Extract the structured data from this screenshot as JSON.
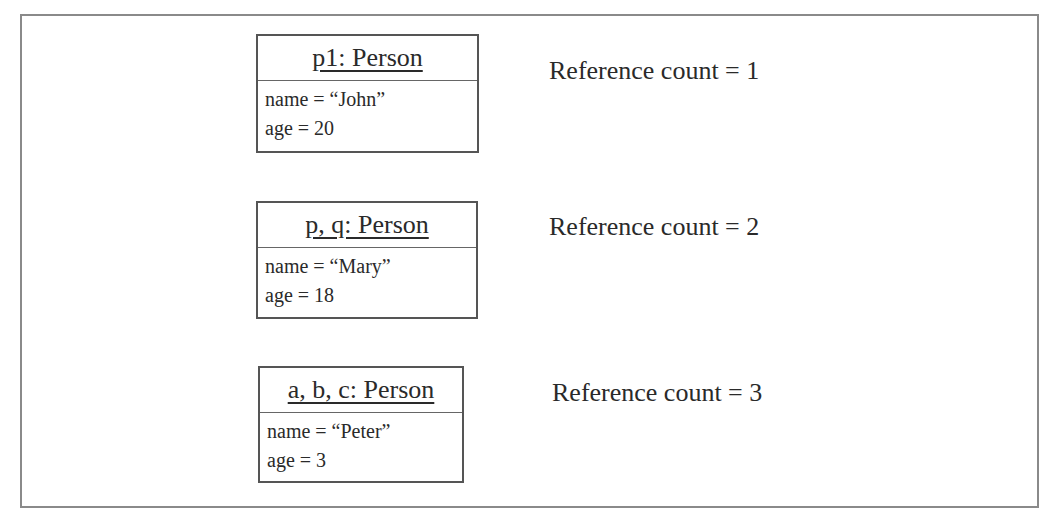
{
  "diagram": {
    "objects": [
      {
        "title": "p1: Person",
        "attributes": [
          "name = “John”",
          "age = 20"
        ],
        "reference_label": "Reference count = 1"
      },
      {
        "title": "p, q: Person",
        "attributes": [
          "name = “Mary”",
          "age = 18"
        ],
        "reference_label": "Reference count = 2"
      },
      {
        "title": "a, b, c: Person",
        "attributes": [
          "name = “Peter”",
          "age = 3"
        ],
        "reference_label": "Reference count = 3"
      }
    ]
  }
}
